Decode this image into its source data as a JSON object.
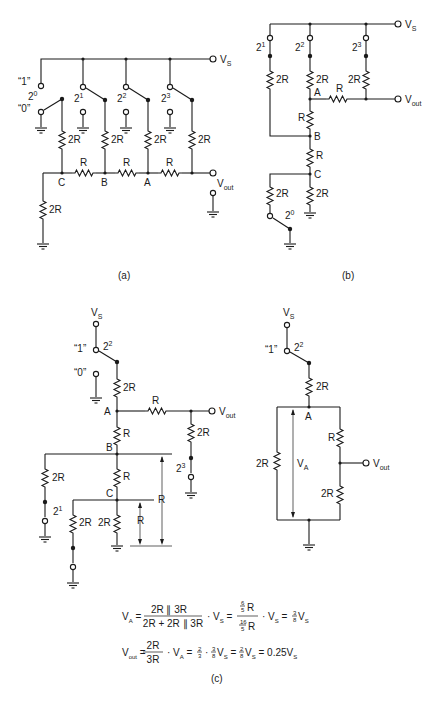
{
  "figure": {
    "panels": [
      {
        "id": "a",
        "caption": "(a)",
        "supply_label": "V",
        "supply_sub": "S",
        "output_label": "V",
        "output_sub": "out",
        "switch_state_labels": {
          "one": "“1”",
          "zero": "“0”"
        },
        "bits": [
          {
            "base": "2",
            "exp": "0",
            "state": "0"
          },
          {
            "base": "2",
            "exp": "1",
            "state": "1"
          },
          {
            "base": "2",
            "exp": "2",
            "state": "1"
          },
          {
            "base": "2",
            "exp": "3",
            "state": "1"
          }
        ],
        "nodes": [
          "C",
          "B",
          "A"
        ],
        "resistors": {
          "leg": "2R",
          "series": "R",
          "termination": "2R"
        }
      },
      {
        "id": "b",
        "caption": "(b)",
        "supply_label": "V",
        "supply_sub": "S",
        "output_label": "V",
        "output_sub": "out",
        "bits": [
          {
            "base": "2",
            "exp": "1"
          },
          {
            "base": "2",
            "exp": "2"
          },
          {
            "base": "2",
            "exp": "3"
          },
          {
            "base": "2",
            "exp": "0"
          }
        ],
        "nodes": [
          "A",
          "B",
          "C"
        ],
        "resistors": {
          "leg": "2R",
          "series": "R"
        }
      },
      {
        "id": "c-left",
        "supply_label": "V",
        "supply_sub": "S",
        "output_label": "V",
        "output_sub": "out",
        "switch_state_labels": {
          "one": "“1”",
          "zero": "“0”"
        },
        "bits": [
          {
            "base": "2",
            "exp": "2"
          },
          {
            "base": "2",
            "exp": "3"
          },
          {
            "base": "2",
            "exp": "1"
          }
        ],
        "nodes": [
          "A",
          "B",
          "C"
        ],
        "equivalent_labels": [
          "R",
          "R"
        ],
        "resistors": {
          "leg": "2R",
          "series": "R"
        }
      },
      {
        "id": "c-right",
        "supply_label": "V",
        "supply_sub": "S",
        "output_label": "V",
        "output_sub": "out",
        "switch_state_labels": {
          "one": "“1”"
        },
        "bit": {
          "base": "2",
          "exp": "2"
        },
        "node": "A",
        "node_voltage_label": "V",
        "node_voltage_sub": "A",
        "resistors": {
          "top": "2R",
          "left": "2R",
          "right_top": "R",
          "right_bottom": "2R"
        }
      }
    ],
    "caption_c": "(c)",
    "equations": [
      {
        "lhs": "V",
        "lhs_sub": "A",
        "frac1_num": "2R ∥ 3R",
        "frac1_den": "2R + 2R ∥ 3R",
        "times": "· V",
        "times_sub": "S",
        "frac2_num_n": "6",
        "frac2_num_d": "5",
        "frac2_num_r": "R",
        "frac2_den_n": "16",
        "frac2_den_d": "5",
        "frac2_den_r": "R",
        "result_n": "3",
        "result_d": "8",
        "result_v": "V",
        "result_sub": "S"
      },
      {
        "lhs": "V",
        "lhs_sub": "out",
        "frac_num": "2R",
        "frac_den": "3R",
        "times": "· V",
        "times_sub": "A",
        "f1_n": "2",
        "f1_d": "3",
        "f2_n": "3",
        "f2_d": "8",
        "f3_n": "2",
        "f3_d": "8",
        "final": "0.25V",
        "final_sub": "S"
      }
    ]
  }
}
